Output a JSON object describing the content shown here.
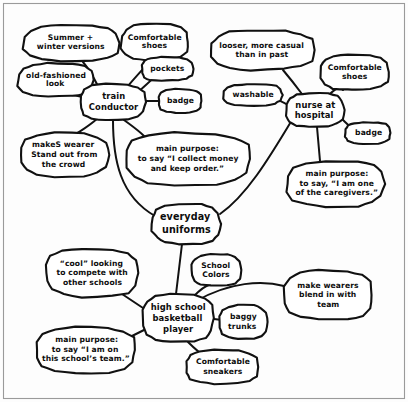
{
  "diagram": {
    "style": "hand-drawn black ink on white paper",
    "ink_color": "#111111",
    "paper_color": "#ffffff",
    "frame": {
      "visible": true,
      "color": "#9a9a9a"
    },
    "center_node": "everyday uniforms",
    "branches": [
      "train conductor",
      "nurse at hospital",
      "high school basketball player"
    ]
  },
  "nodes": [
    {
      "id": "summer-winter-versions",
      "label": "Summer +\nwinter versions",
      "cx": 71,
      "cy": 43,
      "rx": 48,
      "ry": 18,
      "size": "sm",
      "lines": [
        "Summer +",
        "winter versions"
      ]
    },
    {
      "id": "comfortable-shoes-conductor",
      "label": "Comfortable\nshoes",
      "cx": 155,
      "cy": 42,
      "rx": 34,
      "ry": 18,
      "size": "sm",
      "lines": [
        "Comfortable",
        "shoes"
      ]
    },
    {
      "id": "old-fashioned-look",
      "label": "old-fashioned\nlook",
      "cx": 56,
      "cy": 80,
      "rx": 38,
      "ry": 17,
      "size": "sm",
      "lines": [
        "old-fashioned",
        "look"
      ]
    },
    {
      "id": "pockets",
      "label": "pockets",
      "cx": 167,
      "cy": 69,
      "rx": 26,
      "ry": 12,
      "size": "sm",
      "lines": [
        "pockets"
      ]
    },
    {
      "id": "badge-conductor",
      "label": "badge",
      "cx": 180,
      "cy": 101,
      "rx": 22,
      "ry": 12,
      "size": "sm",
      "lines": [
        "badge"
      ]
    },
    {
      "id": "train-conductor",
      "label": "train\nConductor",
      "cx": 113,
      "cy": 102,
      "rx": 33,
      "ry": 18,
      "size": "md",
      "lines": [
        "train",
        "Conductor"
      ]
    },
    {
      "id": "makes-wearer-stand-out",
      "label": "makeS wearer\nStand out from\nthe crowd",
      "cx": 64,
      "cy": 155,
      "rx": 44,
      "ry": 22,
      "size": "sm",
      "lines": [
        "makeS wearer",
        "Stand out from",
        "the crowd"
      ]
    },
    {
      "id": "main-purpose-conductor",
      "label": "main purpose:\nto say “I collect money\nand keep order.”",
      "cx": 188,
      "cy": 159,
      "rx": 63,
      "ry": 26,
      "size": "sm",
      "lines": [
        "main purpose:",
        "to say “I collect money",
        "and keep order.”"
      ]
    },
    {
      "id": "looser-more-casual",
      "label": "looser, more casual\nthan in past",
      "cx": 262,
      "cy": 50,
      "rx": 52,
      "ry": 20,
      "size": "sm",
      "lines": [
        "looser, more casual",
        "than in past"
      ]
    },
    {
      "id": "comfortable-shoes-nurse",
      "label": "Comfortable\nshoes",
      "cx": 355,
      "cy": 72,
      "rx": 35,
      "ry": 18,
      "size": "sm",
      "lines": [
        "Comfortable",
        "shoes"
      ]
    },
    {
      "id": "washable",
      "label": "washable",
      "cx": 253,
      "cy": 95,
      "rx": 30,
      "ry": 11,
      "size": "sm",
      "lines": [
        "washable"
      ]
    },
    {
      "id": "nurse-at-hospital",
      "label": "nurse at\nhospital",
      "cx": 315,
      "cy": 110,
      "rx": 29,
      "ry": 17,
      "size": "md",
      "lines": [
        "nurse at",
        "hospital"
      ]
    },
    {
      "id": "badge-nurse",
      "label": "badge",
      "cx": 368,
      "cy": 133,
      "rx": 23,
      "ry": 11,
      "size": "sm",
      "lines": [
        "badge"
      ]
    },
    {
      "id": "main-purpose-nurse",
      "label": "main purpose:\nto say, “I am one\nof the caregivers.”",
      "cx": 336,
      "cy": 184,
      "rx": 49,
      "ry": 23,
      "size": "sm",
      "lines": [
        "main purpose:",
        "to say, “I am one",
        "of the caregivers.”"
      ]
    },
    {
      "id": "everyday-uniforms",
      "label": "everyday\nuniforms",
      "cx": 186,
      "cy": 224,
      "rx": 34,
      "ry": 20,
      "size": "lg",
      "lines": [
        "everyday",
        "uniforms"
      ]
    },
    {
      "id": "cool-looking",
      "label": "“cool” looking\nto compete with\nother schools",
      "cx": 92,
      "cy": 273,
      "rx": 47,
      "ry": 24,
      "size": "sm",
      "lines": [
        "“cool” looking",
        "to compete with",
        "other schools"
      ]
    },
    {
      "id": "school-colors",
      "label": "School\nColors",
      "cx": 216,
      "cy": 270,
      "rx": 25,
      "ry": 16,
      "size": "sm",
      "lines": [
        "School",
        "Colors"
      ]
    },
    {
      "id": "make-wearers-blend-in",
      "label": "make wearers\nblend in with\nteam",
      "cx": 328,
      "cy": 295,
      "rx": 45,
      "ry": 25,
      "size": "sm",
      "lines": [
        "make wearers",
        "blend in with",
        "team"
      ]
    },
    {
      "id": "high-school-basketball-player",
      "label": "high school\nbasketball\nplayer",
      "cx": 178,
      "cy": 318,
      "rx": 36,
      "ry": 24,
      "size": "md",
      "lines": [
        "high school",
        "basketball",
        "player"
      ]
    },
    {
      "id": "baggy-trunks",
      "label": "baggy\ntrunks",
      "cx": 243,
      "cy": 322,
      "rx": 24,
      "ry": 17,
      "size": "sm",
      "lines": [
        "baggy",
        "trunks"
      ]
    },
    {
      "id": "main-purpose-basketball",
      "label": "main purpose:\nto say “I am on\nthis school’s team.”",
      "cx": 86,
      "cy": 350,
      "rx": 50,
      "ry": 23,
      "size": "sm",
      "lines": [
        "main purpose:",
        "to say “I am on",
        "this school’s team.”"
      ]
    },
    {
      "id": "comfortable-sneakers",
      "label": "Comfortable\nsneakers",
      "cx": 222,
      "cy": 367,
      "rx": 36,
      "ry": 17,
      "size": "sm",
      "lines": [
        "Comfortable",
        "sneakers"
      ]
    }
  ],
  "edges": [
    {
      "id": "edge-conductor-summer",
      "from": "train-conductor",
      "to": "summer-winter-versions",
      "d": "M 99 88 C 93 76 88 68 83 62"
    },
    {
      "id": "edge-conductor-oldfash",
      "from": "train-conductor",
      "to": "old-fashioned-look",
      "d": "M 85 98 C 76 95 70 94 63 95"
    },
    {
      "id": "edge-conductor-shoes",
      "from": "train-conductor",
      "to": "comfortable-shoes-conductor",
      "d": "M 128 86 C 138 74 146 66 151 60"
    },
    {
      "id": "edge-conductor-pockets",
      "from": "train-conductor",
      "to": "pockets",
      "d": "M 138 92 C 146 85 150 81 155 77"
    },
    {
      "id": "edge-conductor-badge",
      "from": "train-conductor",
      "to": "badge-conductor",
      "d": "M 146 101 L 159 101"
    },
    {
      "id": "edge-conductor-standout",
      "from": "train-conductor",
      "to": "makes-wearer-stand-out",
      "d": "M 98 118 C 89 126 82 130 76 134"
    },
    {
      "id": "edge-conductor-purpose",
      "from": "train-conductor",
      "to": "main-purpose-conductor",
      "d": "M 124 120 C 132 126 138 130 144 136"
    },
    {
      "id": "edge-conductor-center",
      "from": "train-conductor",
      "to": "everyday-uniforms",
      "d": "M 113 120 C 113 160 120 196 155 216"
    },
    {
      "id": "edge-nurse-looser",
      "from": "nurse-at-hospital",
      "to": "looser-more-casual",
      "d": "M 302 94 C 293 82 288 76 283 70"
    },
    {
      "id": "edge-nurse-washable",
      "from": "nurse-at-hospital",
      "to": "washable",
      "d": "M 288 105 C 283 102 279 100 274 99"
    },
    {
      "id": "edge-nurse-shoes",
      "from": "nurse-at-hospital",
      "to": "comfortable-shoes-nurse",
      "d": "M 329 95 C 335 89 339 86 343 90"
    },
    {
      "id": "edge-nurse-badge",
      "from": "nurse-at-hospital",
      "to": "badge-nurse",
      "d": "M 341 118 C 346 123 349 126 353 129"
    },
    {
      "id": "edge-nurse-purpose",
      "from": "nurse-at-hospital",
      "to": "main-purpose-nurse",
      "d": "M 317 127 L 320 161"
    },
    {
      "id": "edge-nurse-center",
      "from": "nurse-at-hospital",
      "to": "everyday-uniforms",
      "d": "M 292 120 C 268 160 246 196 220 214"
    },
    {
      "id": "edge-center-basketball",
      "from": "everyday-uniforms",
      "to": "high-school-basketball-player",
      "d": "M 182 244 L 176 294"
    },
    {
      "id": "edge-basketball-cool",
      "from": "high-school-basketball-player",
      "to": "cool-looking",
      "d": "M 143 308 C 134 302 128 298 122 294"
    },
    {
      "id": "edge-basketball-colors",
      "from": "high-school-basketball-player",
      "to": "school-colors",
      "d": "M 194 296 C 200 290 205 286 209 285"
    },
    {
      "id": "edge-basketball-blend",
      "from": "high-school-basketball-player",
      "to": "make-wearers-blend-in",
      "d": "M 196 301 C 230 282 262 280 284 286"
    },
    {
      "id": "edge-basketball-baggy",
      "from": "high-school-basketball-player",
      "to": "baggy-trunks",
      "d": "M 214 319 L 222 320"
    },
    {
      "id": "edge-basketball-purpose",
      "from": "high-school-basketball-player",
      "to": "main-purpose-basketball",
      "d": "M 144 330 C 138 333 134 335 130 337"
    },
    {
      "id": "edge-basketball-sneakers",
      "from": "high-school-basketball-player",
      "to": "comfortable-sneakers",
      "d": "M 188 342 C 196 350 201 354 206 357"
    }
  ]
}
